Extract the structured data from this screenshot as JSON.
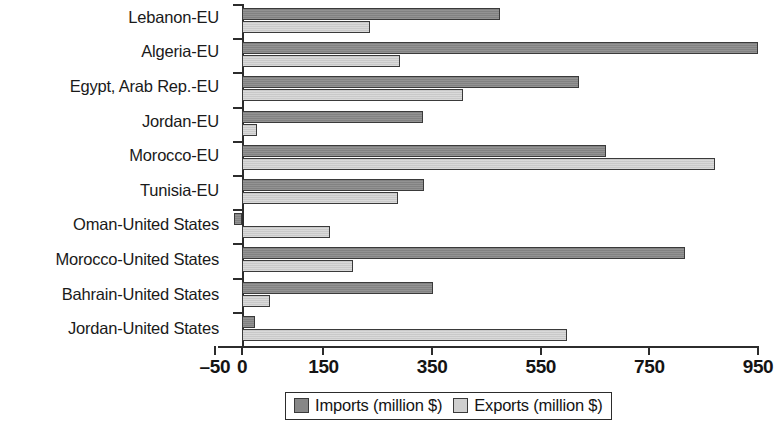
{
  "chart_data": {
    "type": "bar",
    "orientation": "horizontal",
    "title": "",
    "xlabel": "",
    "ylabel": "",
    "xlim": [
      -50,
      950
    ],
    "xticks": [
      -50,
      0,
      150,
      350,
      550,
      750,
      950
    ],
    "xtick_labels": [
      "–50",
      "0",
      "150",
      "350",
      "550",
      "750",
      "950"
    ],
    "grid": false,
    "legend_position": "bottom-center",
    "categories": [
      "Lebanon-EU",
      "Algeria-EU",
      "Egypt, Arab Rep.-EU",
      "Jordan-EU",
      "Morocco-EU",
      "Tunisia-EU",
      "Oman-United States",
      "Morocco-United States",
      "Bahrain-United States",
      "Jordan-United States"
    ],
    "series": [
      {
        "name": "Imports (million $)",
        "color": "#878787",
        "values": [
          475,
          950,
          620,
          333,
          670,
          335,
          -15,
          815,
          352,
          24
        ]
      },
      {
        "name": "Exports (million $)",
        "color": "#cfcfcf",
        "values": [
          236,
          290,
          407,
          28,
          870,
          287,
          162,
          204,
          52,
          599
        ]
      }
    ]
  },
  "legend": {
    "items": [
      {
        "label": "Imports (million $)",
        "swatch": "imports"
      },
      {
        "label": "Exports (million $)",
        "swatch": "exports"
      }
    ]
  }
}
